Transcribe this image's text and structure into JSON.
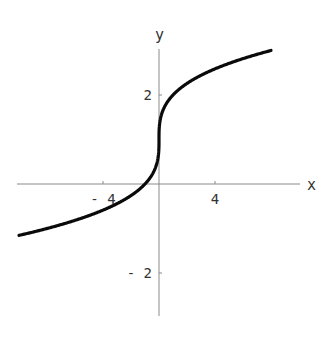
{
  "chart_data": {
    "type": "line",
    "title": "",
    "function": "y = 1 + x^(1/3)",
    "xlabel": "x",
    "ylabel": "y",
    "xlim": [
      -10,
      8
    ],
    "ylim": [
      -3,
      3
    ],
    "x_ticks": [
      {
        "value": -4,
        "label": "-4"
      },
      {
        "value": 4,
        "label": "4"
      }
    ],
    "y_ticks": [
      {
        "value": 2,
        "label": "2"
      },
      {
        "value": -2,
        "label": "-2"
      }
    ],
    "grid": false,
    "legend": null,
    "series": [
      {
        "name": "y = 1 + cbrt(x)",
        "color": "#0a0a0a",
        "x": [
          -10,
          -8,
          -6,
          -4,
          -2,
          -1,
          -0.5,
          -0.1,
          -0.01,
          0,
          0.01,
          0.1,
          0.5,
          1,
          2,
          4,
          6,
          8
        ],
        "y": [
          -1.15,
          -1.0,
          -0.82,
          -0.59,
          -0.26,
          0.0,
          0.21,
          0.54,
          0.78,
          1.0,
          1.22,
          1.46,
          1.79,
          2.0,
          2.26,
          2.59,
          2.82,
          3.0
        ]
      }
    ]
  },
  "layout": {
    "origin_px": [
      159,
      184
    ],
    "x_px_per_unit": 14,
    "y_px_per_unit": 44.5,
    "x_axis_px": [
      17,
      300
    ],
    "y_axis_px": [
      49,
      316
    ]
  }
}
